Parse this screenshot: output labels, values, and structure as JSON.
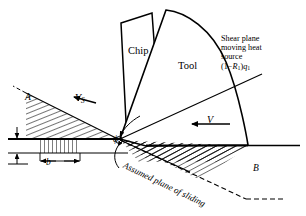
{
  "figure": {
    "type": "diagram",
    "background": "#ffffff",
    "line_color": "#000000",
    "width": 306,
    "height": 216
  },
  "labels": {
    "chip": "Chip",
    "tool": "Tool",
    "region_a": "A",
    "region_b": "B",
    "shear_velocity": "V",
    "shear_velocity_sub": "S",
    "cutting_velocity": "V",
    "width_dim": "b",
    "shear_angle": "ϕ",
    "assumed_plane": "Assumed plane of sliding"
  },
  "annotation": {
    "line1": "Shear plane",
    "line2": "moving heat",
    "line3": "source",
    "formula_open": "(1−",
    "formula_r": "R",
    "formula_r_sub": "1",
    "formula_close": ")",
    "formula_q": "q",
    "formula_q_sub": "1"
  }
}
